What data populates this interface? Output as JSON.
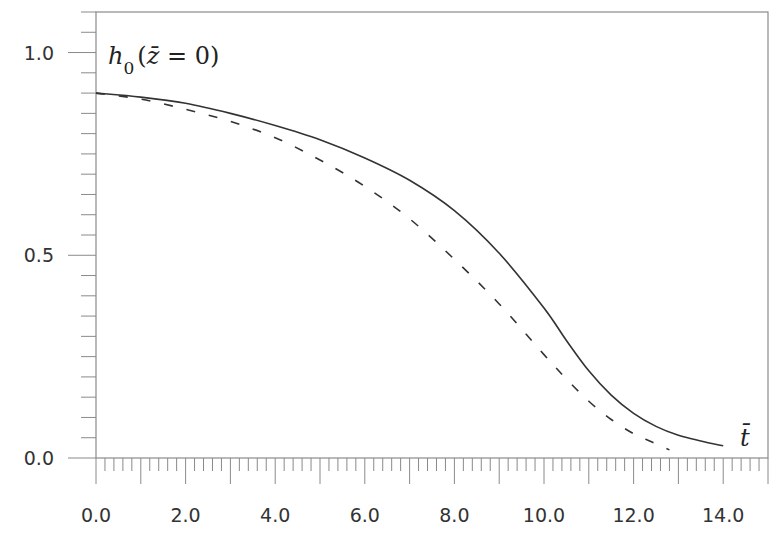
{
  "chart_data": {
    "type": "line",
    "title": "",
    "annotation_ylabel": "h0(z̄ = 0)",
    "annotation_ylabel_parts": {
      "base": "h",
      "sub": "0",
      "open": "(",
      "var": "z̄",
      "rest": " = 0)"
    },
    "xlabel": "t̄",
    "ylabel": "h0(z̄ = 0)",
    "xlim": [
      0.0,
      15.0
    ],
    "ylim": [
      0.0,
      1.1
    ],
    "grid": false,
    "legend": null,
    "x_ticks": [
      "0.0",
      "2.0",
      "4.0",
      "6.0",
      "8.0",
      "10.0",
      "12.0",
      "14.0"
    ],
    "y_ticks": [
      "0.0",
      "0.5",
      "1.0"
    ],
    "x_minor_step": 0.2,
    "y_minor_step": 0.05,
    "series": [
      {
        "name": "solid",
        "style": "solid",
        "color": "#333333",
        "x": [
          0.0,
          1.0,
          2.0,
          3.0,
          4.0,
          5.0,
          6.0,
          7.0,
          8.0,
          9.0,
          10.0,
          10.5,
          11.0,
          11.5,
          12.0,
          12.5,
          13.0,
          13.5,
          14.0
        ],
        "y": [
          0.9,
          0.89,
          0.875,
          0.85,
          0.82,
          0.785,
          0.74,
          0.685,
          0.61,
          0.505,
          0.37,
          0.29,
          0.215,
          0.155,
          0.11,
          0.078,
          0.056,
          0.042,
          0.03
        ]
      },
      {
        "name": "dashed",
        "style": "dashed",
        "color": "#333333",
        "x": [
          0.0,
          1.0,
          2.0,
          3.0,
          4.0,
          5.0,
          6.0,
          7.0,
          8.0,
          9.0,
          10.0,
          10.5,
          11.0,
          11.5,
          12.0,
          12.4,
          12.8
        ],
        "y": [
          0.9,
          0.885,
          0.86,
          0.83,
          0.79,
          0.735,
          0.67,
          0.59,
          0.49,
          0.38,
          0.255,
          0.195,
          0.14,
          0.095,
          0.06,
          0.04,
          0.02
        ]
      }
    ]
  }
}
